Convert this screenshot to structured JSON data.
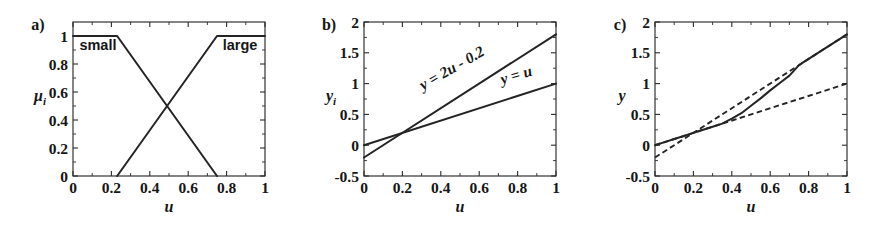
{
  "figure": {
    "panels": [
      {
        "tag": "a)",
        "xlabel": "u",
        "ylabel": "μ",
        "ylabel_sub": "i",
        "xticks": [
          "0",
          "0.2",
          "0.4",
          "0.6",
          "0.8",
          "1"
        ],
        "xtickvals": [
          0,
          0.2,
          0.4,
          0.6,
          0.8,
          1
        ],
        "yticks": [
          "0",
          "0.2",
          "0.4",
          "0.6",
          "0.8",
          "1"
        ],
        "ytickvals": [
          0,
          0.2,
          0.4,
          0.6,
          0.8,
          1
        ],
        "annotations": [
          {
            "text": "small",
            "x": 0.13,
            "y": 0.9
          },
          {
            "text": "large",
            "x": 0.87,
            "y": 0.9
          }
        ]
      },
      {
        "tag": "b)",
        "xlabel": "u",
        "ylabel": "y",
        "ylabel_sub": "i",
        "xticks": [
          "0",
          "0.2",
          "0.4",
          "0.6",
          "0.8",
          "1"
        ],
        "xtickvals": [
          0,
          0.2,
          0.4,
          0.6,
          0.8,
          1
        ],
        "yticks": [
          "-0.5",
          "0",
          "0.5",
          "1",
          "1.5",
          "2"
        ],
        "ytickvals": [
          -0.5,
          0,
          0.5,
          1,
          1.5,
          2
        ],
        "annotations": [
          {
            "text": "y = 2u - 0.2",
            "x": 0.47,
            "y": 1.18,
            "rotate": -30
          },
          {
            "text": "y = u",
            "x": 0.8,
            "y": 1.06,
            "rotate": -17
          }
        ]
      },
      {
        "tag": "c)",
        "xlabel": "u",
        "ylabel": "y",
        "ylabel_sub": "",
        "xticks": [
          "0",
          "0.2",
          "0.4",
          "0.6",
          "0.8",
          "1"
        ],
        "xtickvals": [
          0,
          0.2,
          0.4,
          0.6,
          0.8,
          1
        ],
        "yticks": [
          "-0.5",
          "0",
          "0.5",
          "1",
          "1.5",
          "2"
        ],
        "ytickvals": [
          -0.5,
          0,
          0.5,
          1,
          1.5,
          2
        ],
        "annotations": []
      }
    ]
  },
  "chart_data": [
    {
      "type": "line",
      "panel": "a)",
      "title": "",
      "xlabel": "u",
      "ylabel": "mu_i",
      "xlim": [
        0,
        1
      ],
      "ylim": [
        0,
        1.1
      ],
      "grid": false,
      "legend": "in-plot text labels",
      "series": [
        {
          "name": "small",
          "style": "solid",
          "x": [
            0,
            0.23,
            0.75
          ],
          "values": [
            1,
            1,
            0
          ]
        },
        {
          "name": "large",
          "style": "solid",
          "x": [
            0.23,
            0.75,
            1
          ],
          "values": [
            0,
            1,
            1
          ]
        }
      ],
      "annotations": [
        "small",
        "large"
      ]
    },
    {
      "type": "line",
      "panel": "b)",
      "title": "",
      "xlabel": "u",
      "ylabel": "y_i",
      "xlim": [
        0,
        1
      ],
      "ylim": [
        -0.5,
        2
      ],
      "grid": false,
      "series": [
        {
          "name": "y = 2u - 0.2",
          "style": "solid",
          "x": [
            0,
            1
          ],
          "values": [
            -0.2,
            1.8
          ]
        },
        {
          "name": "y = u",
          "style": "solid",
          "x": [
            0,
            1
          ],
          "values": [
            0,
            1
          ]
        }
      ],
      "annotations": [
        "y = 2u - 0.2",
        "y = u"
      ]
    },
    {
      "type": "line",
      "panel": "c)",
      "title": "",
      "xlabel": "u",
      "ylabel": "y",
      "xlim": [
        0,
        1
      ],
      "ylim": [
        -0.5,
        2
      ],
      "grid": false,
      "series": [
        {
          "name": "interpolated output",
          "style": "solid",
          "x": [
            0,
            0.05,
            0.1,
            0.15,
            0.2,
            0.23,
            0.3,
            0.35,
            0.4,
            0.45,
            0.5,
            0.55,
            0.6,
            0.65,
            0.7,
            0.75,
            0.8,
            0.9,
            1
          ],
          "values": [
            0,
            0.05,
            0.1,
            0.15,
            0.2,
            0.23,
            0.3,
            0.35,
            0.43,
            0.52,
            0.64,
            0.76,
            0.89,
            1.01,
            1.13,
            1.3,
            1.4,
            1.6,
            1.8
          ]
        },
        {
          "name": "y = 2u - 0.2",
          "style": "dashed",
          "x": [
            0,
            1
          ],
          "values": [
            -0.2,
            1.8
          ]
        },
        {
          "name": "y = u",
          "style": "dashed",
          "x": [
            0,
            1
          ],
          "values": [
            0,
            1
          ]
        }
      ],
      "annotations": []
    }
  ]
}
